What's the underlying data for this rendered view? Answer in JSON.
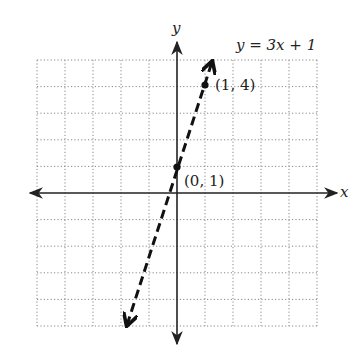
{
  "chart_data": {
    "type": "line",
    "title": "y = 3x + 1",
    "equation": "y = 3x + 1",
    "xlabel": "x",
    "ylabel": "y",
    "xlim": [
      -5,
      5
    ],
    "ylim": [
      -5,
      5
    ],
    "grid": true,
    "grid_style": "dotted",
    "line_style": "dashed",
    "slope": 3,
    "intercept": 1,
    "series": [
      {
        "name": "y = 3x + 1",
        "x": [
          -2,
          1.3
        ],
        "y": [
          -5,
          5
        ]
      }
    ],
    "points": [
      {
        "x": 0,
        "y": 1,
        "label": "(0, 1)"
      },
      {
        "x": 1,
        "y": 4,
        "label": "(1, 4)"
      }
    ]
  },
  "labels": {
    "equation": "y = 3x + 1",
    "x_axis": "x",
    "y_axis": "y",
    "point_a": "(0, 1)",
    "point_b": "(1, 4)"
  }
}
